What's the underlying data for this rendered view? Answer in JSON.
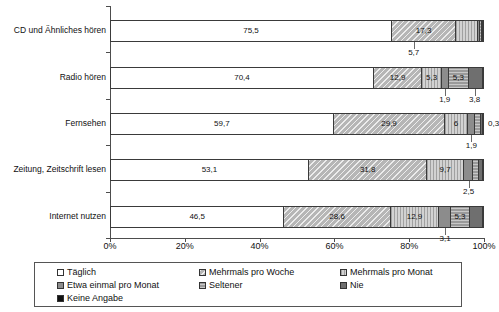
{
  "chart_data": {
    "type": "bar",
    "orientation": "horizontal",
    "stacked": true,
    "stack_mode": "percent",
    "title": "",
    "subtitle": "",
    "xlabel": "",
    "ylabel": "",
    "xlim": [
      0,
      100
    ],
    "xticks": [
      "0%",
      "20%",
      "40%",
      "60%",
      "80%",
      "100%"
    ],
    "xtick_values": [
      0,
      20,
      40,
      60,
      80,
      100
    ],
    "grid": false,
    "legend_position": "bottom",
    "categories": [
      "CD und Ähnliches hören",
      "Radio hören",
      "Fernsehen",
      "Zeitung, Zeitschrift lesen",
      "Internet nutzen"
    ],
    "series": [
      {
        "name": "Täglich",
        "values": [
          75.5,
          70.4,
          59.7,
          53.1,
          46.5
        ]
      },
      {
        "name": "Mehrmals pro Woche",
        "values": [
          17.3,
          12.9,
          29.9,
          31.8,
          28.6
        ]
      },
      {
        "name": "Mehrmals pro Monat",
        "values": [
          5.7,
          5.3,
          6.0,
          9.7,
          12.9
        ]
      },
      {
        "name": "Etwa einmal pro Monat",
        "values": [
          0.7,
          1.9,
          1.9,
          2.5,
          3.1
        ]
      },
      {
        "name": "Seltener",
        "values": [
          0.5,
          5.3,
          1.6,
          1.5,
          5.3
        ]
      },
      {
        "name": "Nie",
        "values": [
          0.2,
          3.8,
          0.6,
          1.2,
          3.4
        ]
      },
      {
        "name": "Keine Angabe",
        "values": [
          0.1,
          0.4,
          0.3,
          0.2,
          0.2
        ]
      }
    ],
    "bar_labels": {
      "CD und Ähnliches hören": {
        "inside": [
          "75,5",
          "17,3"
        ],
        "callouts": [
          "5,7"
        ]
      },
      "Radio hören": {
        "inside": [
          "70,4",
          "12,9",
          "5,3",
          "5,3"
        ],
        "callouts": [
          "1,9",
          "3,8"
        ]
      },
      "Fernsehen": {
        "inside": [
          "59,7",
          "29,9",
          "6"
        ],
        "callouts": [
          "1,9"
        ],
        "outside": [
          "0,3"
        ]
      },
      "Zeitung, Zeitschrift lesen": {
        "inside": [
          "53,1",
          "31,8",
          "9,7"
        ],
        "callouts": [
          "2,5"
        ]
      },
      "Internet nutzen": {
        "inside": [
          "46,5",
          "28,6",
          "12,9",
          "5,3"
        ],
        "callouts": [
          "3,1"
        ]
      }
    }
  },
  "axis": {
    "x_ticks": [
      {
        "label": "0%"
      },
      {
        "label": "20%"
      },
      {
        "label": "40%"
      },
      {
        "label": "60%"
      },
      {
        "label": "80%"
      },
      {
        "label": "100%"
      }
    ],
    "y_categories": [
      {
        "label": "CD und Ähnliches hören"
      },
      {
        "label": "Radio hören"
      },
      {
        "label": "Fernsehen"
      },
      {
        "label": "Zeitung, Zeitschrift lesen"
      },
      {
        "label": "Internet nutzen"
      }
    ]
  },
  "bars": [
    {
      "category": "CD und Ähnliches hören",
      "segments": [
        {
          "series": "Täglich",
          "value": 75.5,
          "label": "75,5",
          "pattern": "p0"
        },
        {
          "series": "Mehrmals pro Woche",
          "value": 17.3,
          "label": "17,3",
          "pattern": "p1"
        },
        {
          "series": "Mehrmals pro Monat",
          "value": 5.7,
          "label": "",
          "pattern": "p2"
        },
        {
          "series": "Etwa einmal pro Monat",
          "value": 0.7,
          "label": "",
          "pattern": "p3"
        },
        {
          "series": "Seltener",
          "value": 0.5,
          "label": "",
          "pattern": "p4"
        },
        {
          "series": "Nie",
          "value": 0.2,
          "label": "",
          "pattern": "p5"
        },
        {
          "series": "Keine Angabe",
          "value": 0.1,
          "label": "",
          "pattern": "p6"
        }
      ],
      "callouts": [
        {
          "text": "5,7",
          "at": 81.2
        }
      ],
      "outside": []
    },
    {
      "category": "Radio hören",
      "segments": [
        {
          "series": "Täglich",
          "value": 70.4,
          "label": "70,4",
          "pattern": "p0"
        },
        {
          "series": "Mehrmals pro Woche",
          "value": 12.9,
          "label": "12,9",
          "pattern": "p1"
        },
        {
          "series": "Mehrmals pro Monat",
          "value": 5.3,
          "label": "5,3",
          "pattern": "p2"
        },
        {
          "series": "Etwa einmal pro Monat",
          "value": 1.9,
          "label": "",
          "pattern": "p3"
        },
        {
          "series": "Seltener",
          "value": 5.3,
          "label": "5,3",
          "pattern": "p4"
        },
        {
          "series": "Nie",
          "value": 3.8,
          "label": "",
          "pattern": "p5"
        },
        {
          "series": "Keine Angabe",
          "value": 0.4,
          "label": "",
          "pattern": "p6"
        }
      ],
      "callouts": [
        {
          "text": "1,9",
          "at": 89.5
        },
        {
          "text": "3,8",
          "at": 97.5
        }
      ],
      "outside": []
    },
    {
      "category": "Fernsehen",
      "segments": [
        {
          "series": "Täglich",
          "value": 59.7,
          "label": "59,7",
          "pattern": "p0"
        },
        {
          "series": "Mehrmals pro Woche",
          "value": 29.9,
          "label": "29,9",
          "pattern": "p1"
        },
        {
          "series": "Mehrmals pro Monat",
          "value": 6.0,
          "label": "6",
          "pattern": "p2"
        },
        {
          "series": "Etwa einmal pro Monat",
          "value": 1.9,
          "label": "",
          "pattern": "p3"
        },
        {
          "series": "Seltener",
          "value": 1.6,
          "label": "",
          "pattern": "p4"
        },
        {
          "series": "Nie",
          "value": 0.6,
          "label": "",
          "pattern": "p5"
        },
        {
          "series": "Keine Angabe",
          "value": 0.3,
          "label": "",
          "pattern": "p6"
        }
      ],
      "callouts": [
        {
          "text": "1,9",
          "at": 96.6
        }
      ],
      "outside": [
        {
          "text": "0,3"
        }
      ]
    },
    {
      "category": "Zeitung, Zeitschrift lesen",
      "segments": [
        {
          "series": "Täglich",
          "value": 53.1,
          "label": "53,1",
          "pattern": "p0"
        },
        {
          "series": "Mehrmals pro Woche",
          "value": 31.8,
          "label": "31,8",
          "pattern": "p1"
        },
        {
          "series": "Mehrmals pro Monat",
          "value": 9.7,
          "label": "9,7",
          "pattern": "p2"
        },
        {
          "series": "Etwa einmal pro Monat",
          "value": 2.5,
          "label": "",
          "pattern": "p3"
        },
        {
          "series": "Seltener",
          "value": 1.5,
          "label": "",
          "pattern": "p4"
        },
        {
          "series": "Nie",
          "value": 1.2,
          "label": "",
          "pattern": "p5"
        },
        {
          "series": "Keine Angabe",
          "value": 0.2,
          "label": "",
          "pattern": "p6"
        }
      ],
      "callouts": [
        {
          "text": "2,5",
          "at": 95.9
        }
      ],
      "outside": []
    },
    {
      "category": "Internet nutzen",
      "segments": [
        {
          "series": "Täglich",
          "value": 46.5,
          "label": "46,5",
          "pattern": "p0"
        },
        {
          "series": "Mehrmals pro Woche",
          "value": 28.6,
          "label": "28,6",
          "pattern": "p1"
        },
        {
          "series": "Mehrmals pro Monat",
          "value": 12.9,
          "label": "12,9",
          "pattern": "p2"
        },
        {
          "series": "Etwa einmal pro Monat",
          "value": 3.1,
          "label": "",
          "pattern": "p3"
        },
        {
          "series": "Seltener",
          "value": 5.3,
          "label": "5,3",
          "pattern": "p4"
        },
        {
          "series": "Nie",
          "value": 3.4,
          "label": "",
          "pattern": "p5"
        },
        {
          "series": "Keine Angabe",
          "value": 0.2,
          "label": "",
          "pattern": "p6"
        }
      ],
      "callouts": [
        {
          "text": "3,1",
          "at": 89.6
        }
      ],
      "outside": []
    }
  ],
  "legend": {
    "rows": [
      [
        {
          "label": "Täglich",
          "pattern": "p0",
          "col": "col-a"
        },
        {
          "label": "Mehrmals pro Woche",
          "pattern": "p1",
          "col": "col-b"
        },
        {
          "label": "Mehrmals pro Monat",
          "pattern": "p2",
          "col": "col-c"
        }
      ],
      [
        {
          "label": "Etwa einmal pro Monat",
          "pattern": "p3",
          "col": "col-a"
        },
        {
          "label": "Seltener",
          "pattern": "p4",
          "col": "col-b"
        },
        {
          "label": "Nie",
          "pattern": "p5",
          "col": "col-c"
        }
      ],
      [
        {
          "label": "Keine Angabe",
          "pattern": "p6",
          "col": "col-a"
        }
      ]
    ]
  }
}
